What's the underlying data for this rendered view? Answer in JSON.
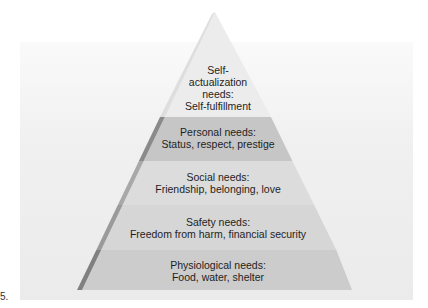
{
  "figure_label": "5.",
  "pyramid": {
    "levels": [
      {
        "id": "self-actualization",
        "lines": [
          "Self-",
          "actualization",
          "needs:",
          "Self-fulfillment"
        ],
        "fill": "#ececec"
      },
      {
        "id": "personal",
        "lines": [
          "Personal needs:",
          "Status, respect, prestige"
        ],
        "fill": "#c6c6c6"
      },
      {
        "id": "social",
        "lines": [
          "Social needs:",
          "Friendship, belonging, love"
        ],
        "fill": "#dcdcdc"
      },
      {
        "id": "safety",
        "lines": [
          "Safety needs:",
          "Freedom from harm, financial security"
        ],
        "fill": "#d7d7d7"
      },
      {
        "id": "physiological",
        "lines": [
          "Physiological needs:",
          "Food, water, shelter"
        ],
        "fill": "#cdcdcd"
      }
    ],
    "edge_color": "#8c8c8c"
  }
}
